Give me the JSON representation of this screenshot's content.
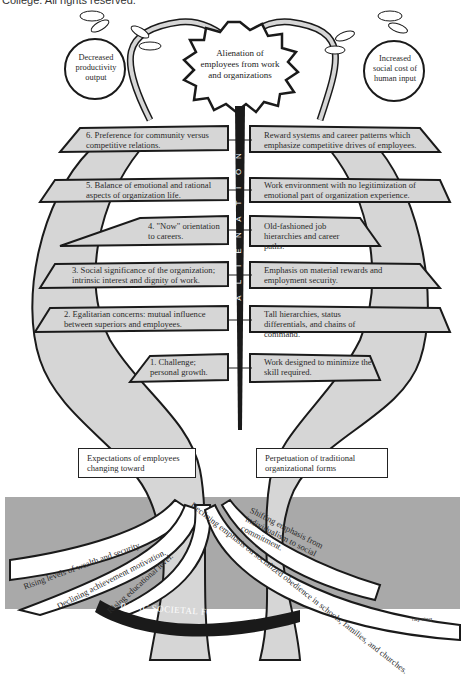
{
  "caption": "College. All rights reserved.",
  "fruits": {
    "left": "Decreased productivity output",
    "center": "Alienation of employees from work and organizations",
    "right": "Increased social cost of human input"
  },
  "trunk_label": "ALIENATION",
  "trunk_letters": [
    "A",
    "L",
    "I",
    "E",
    "N",
    "A",
    "T",
    "I",
    "O",
    "N"
  ],
  "left_branches": [
    {
      "num": "6.",
      "text": "Preference for community versus competitive relations."
    },
    {
      "num": "5.",
      "text": "Balance of emotional and rational aspects of organization life."
    },
    {
      "num": "4.",
      "text": "\"Now\" orientation to careers."
    },
    {
      "num": "3.",
      "text": "Social significance of the organization; intrinsic interest and dignity of work."
    },
    {
      "num": "2.",
      "text": "Egalitarian concerns: mutual influence between superiors and employees."
    },
    {
      "num": "1.",
      "text": "Challenge; personal growth."
    }
  ],
  "right_branches": [
    {
      "text": "Reward systems and career patterns which emphasize competitive drives of employees."
    },
    {
      "text": "Work environment with no legitimization of emotional part of organization experience."
    },
    {
      "text": "Old-fashioned job hierarchies and career paths."
    },
    {
      "text": "Emphasis on material rewards and employment security."
    },
    {
      "text": "Tall hierarchies, status differentials, and chains of command."
    },
    {
      "text": "Work designed to minimize the skill required."
    }
  ],
  "trunk_boxes": {
    "left": "Expectations of employees changing toward",
    "right": "Perpetuation of traditional organizational forms"
  },
  "roots": [
    "Rising levels of wealth and security.",
    "Declining achievement motivation.",
    "Rising educational level.",
    "Declining emphasis on socialized obedience in schools, families, and churches.",
    "Shifting emphasis from individualism to social commitment."
  ],
  "ground_label": "BASIC SOCIETAL FORCES",
  "signature": "ray ring",
  "colors": {
    "ground": "#a9a9a9",
    "bark": "#d6d6d6",
    "ink": "#1a1a1a",
    "paper": "#ffffff"
  }
}
